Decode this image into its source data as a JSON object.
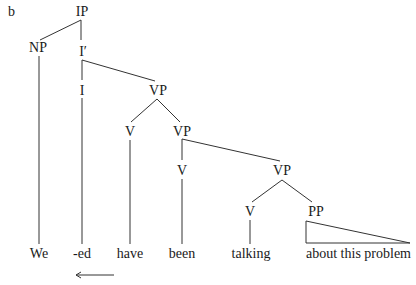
{
  "figure": {
    "label": "b",
    "type": "syntax-tree"
  },
  "nodes": {
    "ip": "IP",
    "np": "NP",
    "i_bar": "I′",
    "i": "I",
    "vp1": "VP",
    "v1": "V",
    "vp2": "VP",
    "v2": "V",
    "vp3": "VP",
    "v3": "V",
    "pp": "PP"
  },
  "leaves": {
    "we": "We",
    "ed": "-ed",
    "have": "have",
    "been": "been",
    "talking": "talking",
    "pp_text": "about this problem"
  },
  "annotations": {
    "arrow": "leftward movement arrow under -ed and have"
  }
}
